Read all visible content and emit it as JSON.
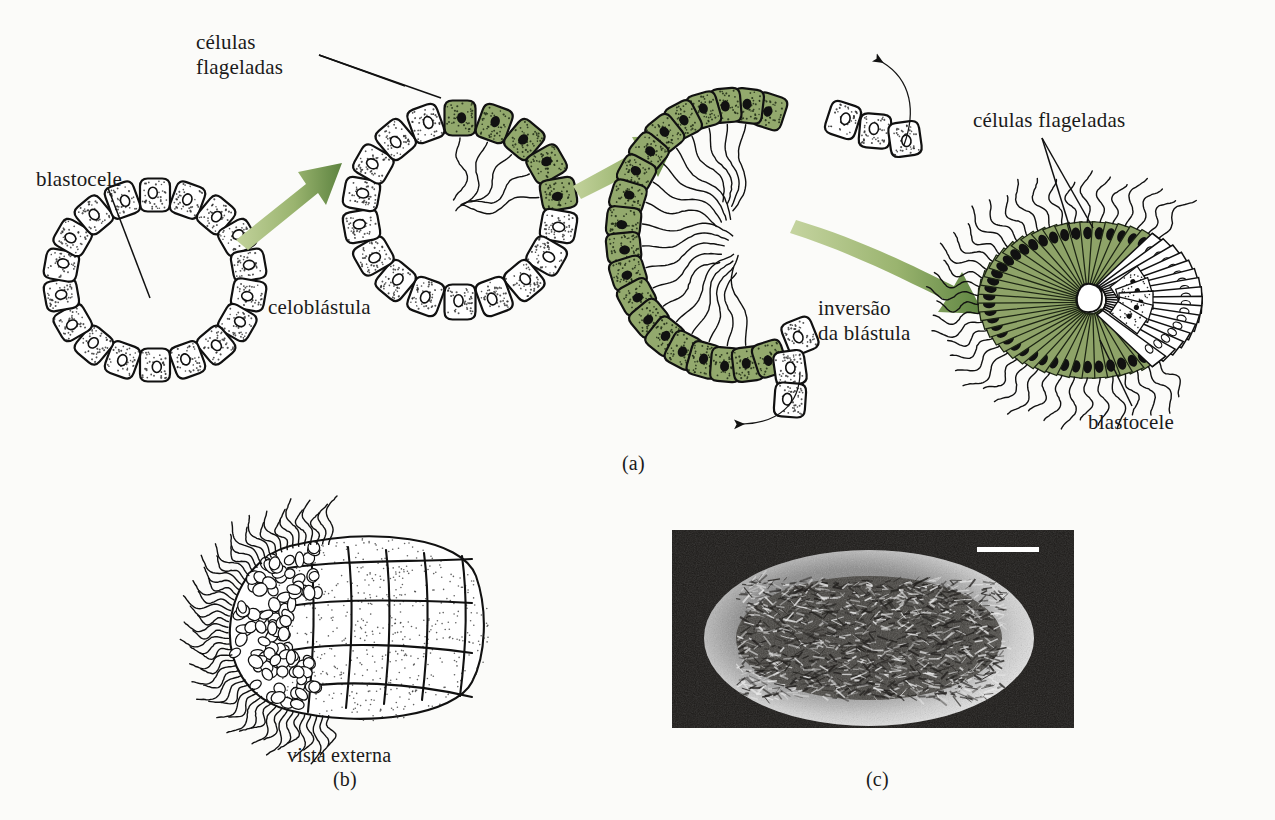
{
  "figure": {
    "title_visible": false,
    "background_color": "#fbfbf9",
    "ink_color": "#111111",
    "flagellated_cell_color": "#93a96d",
    "arrow_color_light": "#b9cb8f",
    "arrow_color_dark": "#5d8340"
  },
  "panel_a": {
    "tag": "(a)",
    "labels": {
      "flagellated_cells_top": "células\nflageladas",
      "blastocoel_left": "blastocele",
      "coeloblastula": "celoblástula",
      "inversion": "inversão\nda blástula",
      "flagellated_cells_right": "células flageladas",
      "blastocoel_right": "blastocele"
    },
    "stages": [
      {
        "name": "coeloblastula",
        "description": "Ring of ~18 undifferentiated white cells enclosing a blastocoel",
        "cell_count": 18,
        "green_cell_count": 0,
        "white_cell_count": 18
      },
      {
        "name": "blastula-with-flagellated-cells",
        "description": "Ring where upper cells have become green flagellated cells with flagella directed into the blastocoel",
        "cell_count": 18,
        "green_cell_count": 9,
        "white_cell_count": 9
      },
      {
        "name": "inverting-blastula",
        "description": "C-shaped blastula opening at right; green flagellated cells form the arc, white cells peel outward at both tips",
        "cell_count": 22,
        "green_cell_count": 16,
        "white_cell_count": 6
      },
      {
        "name": "amphiblastula-larva",
        "description": "Inverted larva: elongated green flagellated cells with external flagella over the anterior three quarters, white cells posteriorly, small central blastocoel",
        "green_cell_count": 38,
        "white_cell_count": 16
      }
    ],
    "arrows": [
      {
        "type": "straight",
        "style": "green-gradient",
        "from": "coeloblastula",
        "to": "blastula-with-flagellated-cells"
      },
      {
        "type": "straight",
        "style": "green-gradient",
        "from": "blastula-with-flagellated-cells",
        "to": "inverting-blastula"
      },
      {
        "type": "straight",
        "style": "green-gradient",
        "from": "inverting-blastula",
        "to": "amphiblastula-larva",
        "label": "inversão\nda blástula"
      },
      {
        "type": "curved",
        "style": "black",
        "direction": "counterclockwise-up-left",
        "position": "upper-lip"
      },
      {
        "type": "curved",
        "style": "black",
        "direction": "clockwise-down-left",
        "position": "lower-lip"
      }
    ]
  },
  "panel_b": {
    "tag": "(b)",
    "caption": "vista externa",
    "description": "External view of the amphiblastula larva: flagellated anterior pole covered with flagella, smooth stippled posterior cells"
  },
  "panel_c": {
    "tag": "(c)",
    "description": "Scanning electron micrograph of an ovoid flagellated larva on a dark background",
    "scale_bar": {
      "visible": true,
      "color": "#ffffff",
      "position": "top-right"
    }
  }
}
